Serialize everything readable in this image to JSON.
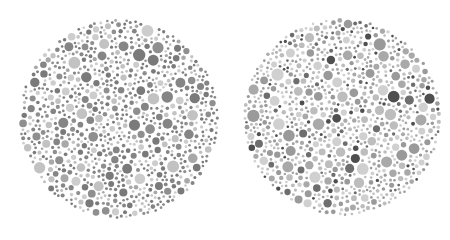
{
  "canvas": {
    "width": 450,
    "height": 233,
    "background": "#ffffff"
  },
  "plates": [
    {
      "name": "left-plate",
      "center": [
        119,
        119
      ],
      "radius": 100,
      "seed": 1337,
      "dot_count": 900,
      "min_r": 1.3,
      "max_r": 6.2,
      "colors": [
        "#7a7a7a",
        "#858585",
        "#8f8f8f",
        "#a8a8a8",
        "#c2c2c2",
        "#cdcdcd"
      ],
      "weights": [
        3,
        3,
        2,
        1,
        2,
        2
      ]
    },
    {
      "name": "right-plate",
      "center": [
        342,
        117
      ],
      "radius": 99,
      "seed": 9091,
      "dot_count": 1000,
      "min_r": 1.3,
      "max_r": 6.2,
      "colors": [
        "#4f4f4f",
        "#6e6e6e",
        "#9a9a9a",
        "#a9a9a9",
        "#bdbdbd",
        "#d0d0d0"
      ],
      "weights": [
        1,
        1,
        3,
        3,
        3,
        3
      ]
    }
  ]
}
